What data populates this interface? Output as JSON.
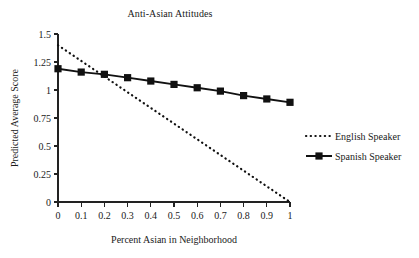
{
  "chart_data": {
    "type": "line",
    "title": "Anti-Asian Attitudes",
    "xlabel": "Percent Asian in Neighborhood",
    "ylabel": "Predicted Average Score",
    "x": [
      0,
      0.1,
      0.2,
      0.3,
      0.4,
      0.5,
      0.6,
      0.7,
      0.8,
      0.9,
      1
    ],
    "xtick_labels": [
      "0",
      "0.1",
      "0.2",
      "0.3",
      "0.4",
      "0.5",
      "0.6",
      "0.7",
      "0.8",
      "0.9",
      "1"
    ],
    "ytick_labels": [
      "0",
      "0.25",
      "0.5",
      "0.75",
      "1",
      "1.25",
      "1.5"
    ],
    "ytick_values": [
      0,
      0.25,
      0.5,
      0.75,
      1,
      1.25,
      1.5
    ],
    "xlim": [
      0,
      1
    ],
    "ylim": [
      0,
      1.5
    ],
    "grid": false,
    "legend_position": "right",
    "series": [
      {
        "name": "English Speaker",
        "style": "dotted",
        "marker": "none",
        "color": "#111111",
        "values": [
          1.4,
          1.26,
          1.12,
          0.98,
          0.84,
          0.7,
          0.56,
          0.42,
          0.28,
          0.14,
          0.0
        ]
      },
      {
        "name": "Spanish Speaker",
        "style": "solid",
        "marker": "square",
        "color": "#111111",
        "values": [
          1.19,
          1.16,
          1.14,
          1.11,
          1.08,
          1.05,
          1.02,
          0.99,
          0.95,
          0.92,
          0.89
        ]
      }
    ]
  },
  "legend": {
    "entries": [
      {
        "label": "English Speaker"
      },
      {
        "label": "Spanish Speaker"
      }
    ]
  }
}
